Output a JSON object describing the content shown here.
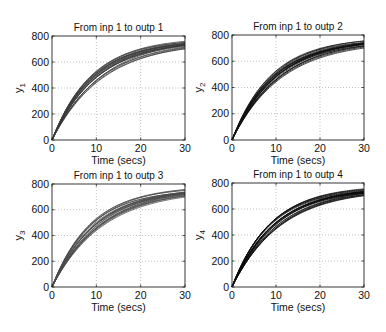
{
  "figure": {
    "layout": "2x2 subplots",
    "background": "#ffffff"
  },
  "chart_data": [
    {
      "type": "line",
      "title": "From inp 1 to outp 1",
      "xlabel": "Time (secs)",
      "ylabel": "y",
      "ylabel_subscript": "1",
      "xlim": [
        0,
        30
      ],
      "ylim": [
        0,
        800
      ],
      "xticks": [
        0,
        10,
        20,
        30
      ],
      "yticks": [
        0,
        200,
        400,
        600,
        800
      ],
      "grid": true,
      "line_color": "#3a3a3a",
      "description": "Family of ~20 first-order step responses y=K(1-exp(-t/tau))",
      "series_params": {
        "K_range": [
          750,
          790
        ],
        "tau_range": [
          8.5,
          11.5
        ],
        "count": 20
      },
      "sample_values": {
        "t": [
          0,
          5,
          10,
          15,
          20,
          25,
          30
        ],
        "upper": [
          0,
          340,
          525,
          630,
          700,
          735,
          752
        ],
        "lower": [
          0,
          280,
          450,
          560,
          630,
          680,
          710
        ]
      },
      "box": {
        "left": 52,
        "top": 36,
        "right": 185,
        "bottom": 140
      }
    },
    {
      "type": "line",
      "title": "From inp 1 to outp 2",
      "xlabel": "Time (secs)",
      "ylabel": "y",
      "ylabel_subscript": "2",
      "xlim": [
        0,
        30
      ],
      "ylim": [
        0,
        800
      ],
      "xticks": [
        0,
        10,
        20,
        30
      ],
      "yticks": [
        0,
        200,
        400,
        600,
        800
      ],
      "grid": true,
      "line_color": "#111111",
      "description": "Family of ~20 first-order step responses y=K(1-exp(-t/tau))",
      "series_params": {
        "K_range": [
          750,
          790
        ],
        "tau_range": [
          8.5,
          11.5
        ],
        "count": 20
      },
      "sample_values": {
        "t": [
          0,
          5,
          10,
          15,
          20,
          25,
          30
        ],
        "upper": [
          0,
          340,
          525,
          630,
          700,
          735,
          752
        ],
        "lower": [
          0,
          280,
          450,
          560,
          630,
          680,
          710
        ]
      },
      "box": {
        "left": 232,
        "top": 35,
        "right": 364,
        "bottom": 140
      }
    },
    {
      "type": "line",
      "title": "From inp 1 to outp 3",
      "xlabel": "Time (secs)",
      "ylabel": "y",
      "ylabel_subscript": "3",
      "xlim": [
        0,
        30
      ],
      "ylim": [
        0,
        800
      ],
      "xticks": [
        0,
        10,
        20,
        30
      ],
      "yticks": [
        0,
        200,
        400,
        600,
        800
      ],
      "grid": true,
      "line_color": "#4a4a4a",
      "description": "Family of ~20 first-order step responses y=K(1-exp(-t/tau))",
      "series_params": {
        "K_range": [
          750,
          790
        ],
        "tau_range": [
          8.5,
          11.5
        ],
        "count": 20
      },
      "sample_values": {
        "t": [
          0,
          5,
          10,
          15,
          20,
          25,
          30
        ],
        "upper": [
          0,
          340,
          525,
          630,
          700,
          735,
          752
        ],
        "lower": [
          0,
          280,
          450,
          560,
          630,
          680,
          710
        ]
      },
      "box": {
        "left": 52,
        "top": 184,
        "right": 185,
        "bottom": 287
      }
    },
    {
      "type": "line",
      "title": "From inp 1 to outp 4",
      "xlabel": "Time (secs)",
      "ylabel": "y",
      "ylabel_subscript": "4",
      "xlim": [
        0,
        30
      ],
      "ylim": [
        0,
        800
      ],
      "xticks": [
        0,
        10,
        20,
        30
      ],
      "yticks": [
        0,
        200,
        400,
        600,
        800
      ],
      "grid": true,
      "line_color": "#0a0a0a",
      "description": "Family of ~20 first-order step responses y=K(1-exp(-t/tau))",
      "series_params": {
        "K_range": [
          750,
          790
        ],
        "tau_range": [
          8.5,
          11.5
        ],
        "count": 20
      },
      "sample_values": {
        "t": [
          0,
          5,
          10,
          15,
          20,
          25,
          30
        ],
        "upper": [
          0,
          340,
          525,
          630,
          700,
          735,
          752
        ],
        "lower": [
          0,
          280,
          450,
          560,
          630,
          680,
          710
        ]
      },
      "box": {
        "left": 232,
        "top": 183,
        "right": 364,
        "bottom": 287
      }
    }
  ]
}
